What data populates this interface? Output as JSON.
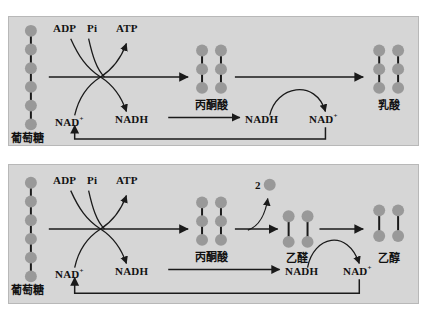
{
  "figure": {
    "type": "biochemical-pathway-diagram",
    "panel_background": "#d6d6d6",
    "molecule_color": "#999999",
    "line_color": "#1a1a1a",
    "page_background": "#ffffff"
  },
  "panels": [
    {
      "id": "lactic-fermentation",
      "name": "lactic-acid-fermentation-panel",
      "labels": {
        "substrate": "葡萄糖",
        "adp": "ADP",
        "pi": "Pi",
        "atp": "ATP",
        "nad_left": "NAD",
        "nad_left_charge": "+",
        "nadh_left": "NADH",
        "intermediate": "丙酮酸",
        "nadh_right": "NADH",
        "nad_right": "NAD",
        "nad_right_charge": "+",
        "product": "乳酸"
      },
      "molecules": [
        {
          "name": "glucose",
          "label": "葡萄糖",
          "columns": 1,
          "circles_per_column": 6
        },
        {
          "name": "pyruvate",
          "label": "丙酮酸",
          "columns": 2,
          "circles_per_column": 3
        },
        {
          "name": "lactate",
          "label": "乳酸",
          "columns": 2,
          "circles_per_column": 3
        }
      ]
    },
    {
      "id": "alcoholic-fermentation",
      "name": "alcoholic-fermentation-panel",
      "labels": {
        "substrate": "葡萄糖",
        "adp": "ADP",
        "pi": "Pi",
        "atp": "ATP",
        "nad_left": "NAD",
        "nad_left_charge": "+",
        "nadh_left": "NADH",
        "intermediate": "丙酮酸",
        "co2_count": "2",
        "acetaldehyde": "乙醛",
        "nadh_right": "NADH",
        "nad_right": "NAD",
        "nad_right_charge": "+",
        "product": "乙醇"
      },
      "molecules": [
        {
          "name": "glucose",
          "label": "葡萄糖",
          "columns": 1,
          "circles_per_column": 6
        },
        {
          "name": "pyruvate",
          "label": "丙酮酸",
          "columns": 2,
          "circles_per_column": 3
        },
        {
          "name": "carbon-dioxide",
          "label": "2",
          "columns": 1,
          "circles_per_column": 1
        },
        {
          "name": "acetaldehyde",
          "label": "乙醛",
          "columns": 2,
          "circles_per_column": 2
        },
        {
          "name": "ethanol",
          "label": "乙醇",
          "columns": 2,
          "circles_per_column": 2
        }
      ]
    }
  ]
}
